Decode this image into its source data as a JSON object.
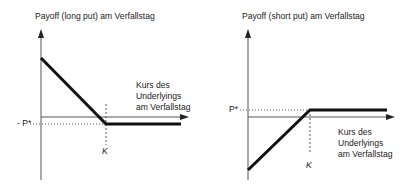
{
  "charts": {
    "long_put": {
      "title": "Payoff (long put) am Verfallstag",
      "xlabel_lines": [
        "Kurs des",
        "Underlyings",
        "am Verfallstag"
      ],
      "strike_label": "K",
      "premium_label": "- P*"
    },
    "short_put": {
      "title": "Payoff (short put) am Verfallstag",
      "xlabel_lines": [
        "Kurs des",
        "Underlyings",
        "am Verfallstag"
      ],
      "strike_label": "K",
      "premium_label": "P*"
    }
  },
  "colors": {
    "axis": "#555555",
    "payoff": "#111111",
    "guide": "#555555"
  }
}
